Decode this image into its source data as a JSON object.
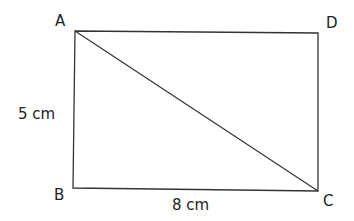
{
  "diagram": {
    "type": "rectangle-with-diagonal",
    "vertices": {
      "A": {
        "label": "A",
        "x": 75,
        "y": 31
      },
      "B": {
        "label": "B",
        "x": 73,
        "y": 188
      },
      "C": {
        "label": "C",
        "x": 318,
        "y": 191
      },
      "D": {
        "label": "D",
        "x": 318,
        "y": 33
      }
    },
    "edges": [
      [
        "A",
        "D"
      ],
      [
        "D",
        "C"
      ],
      [
        "C",
        "B"
      ],
      [
        "B",
        "A"
      ],
      [
        "A",
        "C"
      ]
    ],
    "dimensions": {
      "height_label": "5 cm",
      "width_label": "8 cm"
    },
    "line_color": "#333333"
  }
}
